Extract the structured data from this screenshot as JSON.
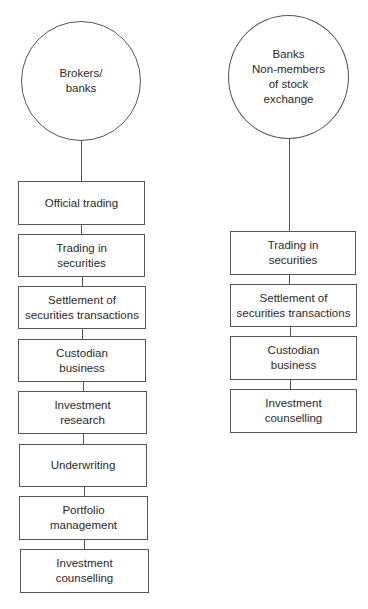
{
  "left_column": {
    "root": "Brokers/\nbanks",
    "items": [
      "Official trading",
      "Trading in\nsecurities",
      "Settlement of\nsecurities transactions",
      "Custodian\nbusiness",
      "Investment\nresearch",
      "Underwriting",
      "Portfolio\nmanagement",
      "Investment\ncounselling"
    ]
  },
  "right_column": {
    "root": "Banks\nNon-members\nof stock\nexchange",
    "items": [
      "Trading in\nsecurities",
      "Settlement of\nsecurities transactions",
      "Custodian\nbusiness",
      "Investment\ncounselling"
    ]
  }
}
